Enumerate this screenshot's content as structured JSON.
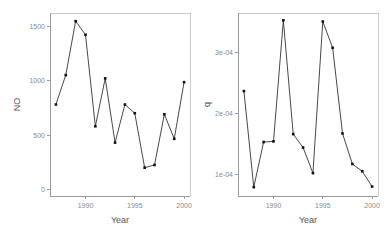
{
  "figure": {
    "background": "#ffffff",
    "point_color": "#111111",
    "line_color": "#333333",
    "axis_color": "#9a9a9a",
    "frame_color": "#c9c9c9",
    "tick_label_color": "#8a8a8a",
    "axis_title_color": "#555555"
  },
  "chart_data": [
    {
      "type": "line",
      "panel": "left",
      "title": "",
      "xlabel": "Year",
      "ylabel": "NO",
      "x": [
        1987,
        1988,
        1989,
        1990,
        1991,
        1992,
        1993,
        1994,
        1995,
        1996,
        1997,
        1998,
        1999,
        2000
      ],
      "values": [
        780,
        1050,
        1545,
        1420,
        580,
        1020,
        430,
        780,
        700,
        200,
        225,
        690,
        465,
        985
      ],
      "xlim": [
        1986.4,
        2000.6
      ],
      "ylim": [
        -60,
        1620
      ],
      "xticks": [
        1990,
        1995,
        2000
      ],
      "xtick_labels": [
        "1990",
        "1995",
        "2000"
      ],
      "yticks": [
        0,
        500,
        1000,
        1500
      ],
      "ytick_labels": [
        "0",
        "500",
        "1000",
        "1500"
      ],
      "grid": false,
      "legend": "none",
      "markers": true
    },
    {
      "type": "line",
      "panel": "right",
      "title": "",
      "xlabel": "Year",
      "ylabel": "q",
      "x": [
        1987,
        1988,
        1989,
        1990,
        1991,
        1992,
        1993,
        1994,
        1995,
        1996,
        1997,
        1998,
        1999,
        2000
      ],
      "values": [
        0.000236,
        7.85e-05,
        0.0001525,
        0.0001535,
        0.000352,
        0.0001655,
        0.0001435,
        0.0001015,
        0.00035,
        0.000307,
        0.0001665,
        0.0001165,
        0.0001045,
        7.95e-05
      ],
      "xlim": [
        1986.4,
        2000.6
      ],
      "ylim": [
        6.4e-05,
        0.000364
      ],
      "xticks": [
        1990,
        1995,
        2000
      ],
      "xtick_labels": [
        "1990",
        "1995",
        "2000"
      ],
      "yticks": [
        0.0001,
        0.0002,
        0.0003
      ],
      "ytick_labels": [
        "1e-04",
        "2e-04",
        "3e-04"
      ],
      "grid": false,
      "legend": "none",
      "markers": true
    }
  ]
}
